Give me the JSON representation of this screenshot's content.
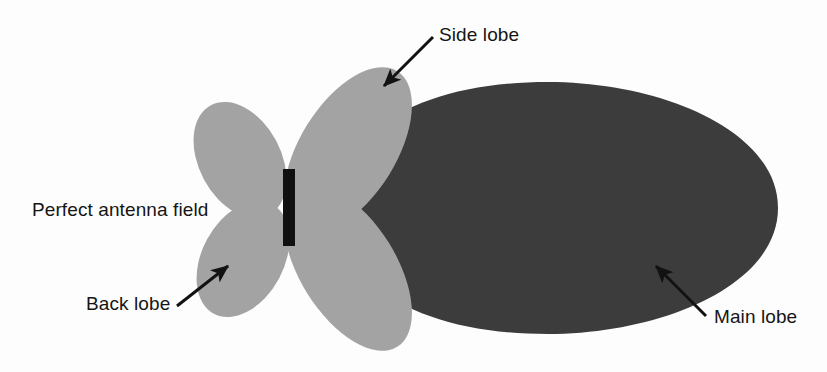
{
  "figure": {
    "background_color": "#fdfdfd",
    "main_lobe_color": "#3c3c3c",
    "side_lobe_color": "#a3a3a3",
    "antenna_color": "#101010",
    "arrow_color": "#121212",
    "text_color": "#151515"
  },
  "labels": {
    "side_lobe": "Side lobe",
    "perfect_antenna_field": "Perfect antenna field",
    "back_lobe": "Back lobe",
    "main_lobe": "Main lobe"
  },
  "diagram_data": {
    "type": "diagram",
    "subject": "Antenna radiation pattern (polar lobe plot)",
    "antenna_element": {
      "name": "antenna-bar",
      "shape": "rectangle",
      "x": 283,
      "y": 169,
      "width": 12,
      "height": 77,
      "color": "#101010"
    },
    "lobes": [
      {
        "name": "main-lobe",
        "label": "Main lobe",
        "shape": "teardrop",
        "color": "#3c3c3c",
        "origin": [
          302,
          208
        ],
        "center": [
          566,
          208
        ],
        "radius_x": 212,
        "radius_y": 124,
        "direction_deg": 0,
        "relative_size": 1.0
      },
      {
        "name": "upper-left-back-lobe",
        "label": "",
        "shape": "ellipse",
        "color": "#a3a3a3",
        "center": [
          240,
          160
        ],
        "radius_x": 41,
        "radius_y": 62,
        "rotation_deg": -28,
        "relative_size": 0.28
      },
      {
        "name": "lower-left-back-lobe",
        "label": "Back lobe",
        "shape": "ellipse",
        "color": "#a3a3a3",
        "center": [
          243,
          259
        ],
        "radius_x": 41,
        "radius_y": 62,
        "rotation_deg": 28,
        "relative_size": 0.28
      },
      {
        "name": "upper-right-side-lobe",
        "label": "Side lobe",
        "shape": "ellipse",
        "color": "#a3a3a3",
        "center": [
          348,
          150
        ],
        "radius_x": 48,
        "radius_y": 93,
        "rotation_deg": 32,
        "relative_size": 0.45
      },
      {
        "name": "lower-right-side-lobe",
        "label": "",
        "shape": "ellipse",
        "color": "#a3a3a3",
        "center": [
          348,
          268
        ],
        "radius_x": 48,
        "radius_y": 93,
        "rotation_deg": -32,
        "relative_size": 0.45
      }
    ],
    "annotations": [
      {
        "name": "side-lobe-annotation",
        "text": "Side lobe",
        "text_position": [
          439,
          25
        ],
        "arrow_start": [
          433,
          37
        ],
        "arrow_end": [
          381,
          89
        ]
      },
      {
        "name": "perfect-antenna-field-annotation",
        "text": "Perfect antenna field",
        "text_position": [
          32,
          200
        ],
        "arrow_start": null,
        "arrow_end": null
      },
      {
        "name": "back-lobe-annotation",
        "text": "Back lobe",
        "text_position": [
          86,
          294
        ],
        "arrow_start": [
          177,
          306
        ],
        "arrow_end": [
          231,
          263
        ]
      },
      {
        "name": "main-lobe-annotation",
        "text": "Main lobe",
        "text_position": [
          714,
          307
        ],
        "arrow_start": [
          706,
          316
        ],
        "arrow_end": [
          653,
          263
        ]
      }
    ]
  }
}
